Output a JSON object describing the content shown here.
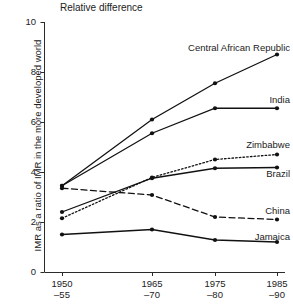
{
  "chart_data": {
    "type": "line",
    "title": "Relative difference",
    "xlabel": "",
    "ylabel": "IMR as a ratio of  IMR in the more developed world",
    "categories": [
      "1950–55",
      "1965–70",
      "1975–80",
      "1985–90"
    ],
    "category_lines": [
      [
        "1950",
        "–55"
      ],
      [
        "1965",
        "–70"
      ],
      [
        "1975",
        "–80"
      ],
      [
        "1985",
        "–90"
      ]
    ],
    "ylim": [
      0,
      10
    ],
    "yticks": [
      0,
      2,
      4,
      6,
      8,
      10
    ],
    "ytick_labels": [
      "0",
      "2",
      "4",
      "6",
      "8",
      "10"
    ],
    "grid": false,
    "legend": "inline-right-labels",
    "series": [
      {
        "name": "Central African Republic",
        "style": "solid",
        "values": [
          3.45,
          6.1,
          7.55,
          8.7
        ]
      },
      {
        "name": "India",
        "style": "solid",
        "values": [
          3.45,
          5.55,
          6.55,
          6.55
        ]
      },
      {
        "name": "Zimbabwe",
        "style": "dotted",
        "values": [
          2.15,
          3.78,
          4.5,
          4.7
        ]
      },
      {
        "name": "Brazil",
        "style": "solid",
        "values": [
          2.4,
          3.75,
          4.15,
          4.18
        ]
      },
      {
        "name": "China",
        "style": "dashed",
        "values": [
          3.35,
          3.08,
          2.2,
          2.1
        ]
      },
      {
        "name": "Jamaica",
        "style": "solid",
        "values": [
          1.5,
          1.7,
          1.28,
          1.2
        ]
      }
    ],
    "series_label_positions": [
      {
        "name": "Central African Republic",
        "x": 290,
        "y": 52
      },
      {
        "name": "India",
        "x": 290,
        "y": 104
      },
      {
        "name": "Zimbabwe",
        "x": 290,
        "y": 149
      },
      {
        "name": "Brazil",
        "x": 290,
        "y": 178
      },
      {
        "name": "China",
        "x": 290,
        "y": 215
      },
      {
        "name": "Jamaica",
        "x": 290,
        "y": 241
      }
    ]
  }
}
